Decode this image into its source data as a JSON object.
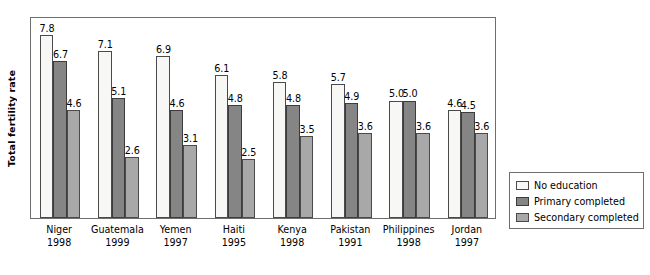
{
  "chart_data": {
    "type": "bar",
    "title": "",
    "xlabel": "",
    "ylabel": "Total fertility rate",
    "ylim": [
      0,
      8.6
    ],
    "grid": false,
    "legend_position": "right-bottom-outside",
    "categories": [
      "Niger\n1998",
      "Guatemala\n1999",
      "Yemen\n1997",
      "Haiti\n1995",
      "Kenya\n1998",
      "Pakistan\n1991",
      "Philippines\n1998",
      "Jordan\n1997"
    ],
    "category_names": [
      "Niger",
      "Guatemala",
      "Yemen",
      "Haiti",
      "Kenya",
      "Pakistan",
      "Philippines",
      "Jordan"
    ],
    "category_years": [
      "1998",
      "1999",
      "1997",
      "1995",
      "1998",
      "1991",
      "1998",
      "1997"
    ],
    "series": [
      {
        "name": "No education",
        "color": "#f7f7f5",
        "values": [
          7.8,
          7.1,
          6.9,
          6.1,
          5.8,
          5.7,
          5.0,
          4.6
        ],
        "labels": [
          "7.8",
          "7.1",
          "6.9",
          "6.1",
          "5.8",
          "5.7",
          "5.0",
          "4.6"
        ]
      },
      {
        "name": "Primary completed",
        "color": "#858585",
        "values": [
          6.7,
          5.1,
          4.6,
          4.8,
          4.8,
          4.9,
          5.0,
          4.5
        ],
        "labels": [
          "6.7",
          "5.1",
          "4.6",
          "4.8",
          "4.8",
          "4.9",
          "5.0",
          "4.5"
        ]
      },
      {
        "name": "Secondary completed",
        "color": "#a8a8a8",
        "values": [
          4.6,
          2.6,
          3.1,
          2.5,
          3.5,
          3.6,
          3.6,
          3.6
        ],
        "labels": [
          "4.6",
          "2.6",
          "3.1",
          "2.5",
          "3.5",
          "3.6",
          "3.6",
          "3.6"
        ]
      }
    ]
  },
  "legend": {
    "items": [
      {
        "label": "No education"
      },
      {
        "label": "Primary completed"
      },
      {
        "label": "Secondary completed"
      }
    ]
  },
  "axis": {
    "y_title": "Total fertility rate"
  }
}
